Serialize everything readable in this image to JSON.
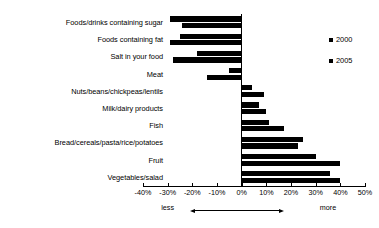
{
  "chart_data": {
    "type": "bar",
    "orientation": "horizontal",
    "title": "",
    "subtitle": "",
    "xlabel": "",
    "ylabel": "",
    "xlim": [
      -40,
      50
    ],
    "xtick_step": 10,
    "grid": false,
    "legend_position": "right",
    "xticks": [
      "-40%",
      "-30%",
      "-20%",
      "-10%",
      "0%",
      "10%",
      "20%",
      "30%",
      "40%",
      "50%"
    ],
    "xtick_values": [
      -40,
      -30,
      -20,
      -10,
      0,
      10,
      20,
      30,
      40,
      50
    ],
    "direction_labels": {
      "negative": "less",
      "positive": "more"
    },
    "categories": [
      "Foods/drinks containing sugar",
      "Foods containing fat",
      "Salt in your food",
      "Meat",
      "Nuts/beans/chickpeas/lentils",
      "Milk/dairy products",
      "Fish",
      "Bread/cereals/pasta/rice/potatoes",
      "Fruit",
      "Vegetables/salad"
    ],
    "series": [
      {
        "name": "2000",
        "color": "#000000",
        "values": [
          -29,
          -25,
          -18,
          -5,
          4,
          7,
          11,
          25,
          30,
          36
        ]
      },
      {
        "name": "2005",
        "color": "#000000",
        "values": [
          -24,
          -29,
          -28,
          -14,
          9,
          10,
          17,
          23,
          40,
          40
        ]
      }
    ]
  },
  "legend": {
    "items": [
      {
        "label": "2000"
      },
      {
        "label": "2005"
      }
    ]
  }
}
